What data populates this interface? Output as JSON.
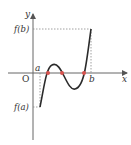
{
  "diagram": {
    "axes": {
      "x_label": "x",
      "y_label": "y",
      "origin_label": "O"
    },
    "points": {
      "a_label": "a",
      "b_label": "b",
      "fa_label": "f(a)",
      "fb_label": "f(b)"
    },
    "curve_color": "#2b2b2b",
    "root_color": "#d9534f",
    "axis_color": "#555555",
    "guide_color": "#888888",
    "roots_count": 3
  }
}
